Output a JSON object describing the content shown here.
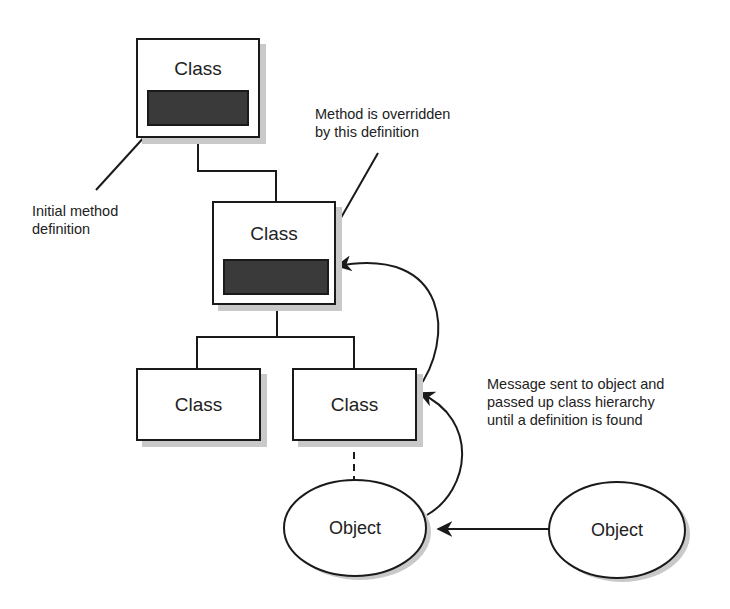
{
  "diagram": {
    "type": "class-hierarchy-method-lookup",
    "colors": {
      "stroke": "#1a1a1a",
      "method_fill": "#3a3a3a",
      "shadow": "#c9c9c9",
      "background": "#ffffff"
    },
    "classes": [
      {
        "id": "top",
        "label": "Class",
        "has_method": true
      },
      {
        "id": "middle",
        "label": "Class",
        "has_method": true
      },
      {
        "id": "bottom-left",
        "label": "Class",
        "has_method": false
      },
      {
        "id": "bottom-right",
        "label": "Class",
        "has_method": false
      }
    ],
    "objects": [
      {
        "id": "instance",
        "label": "Object"
      },
      {
        "id": "sender",
        "label": "Object"
      }
    ],
    "annotations": {
      "initial": [
        "Initial method",
        "definition"
      ],
      "override": [
        "Method is overridden",
        "by this definition"
      ],
      "message": [
        "Message sent to object and",
        "passed up class hierarchy",
        "until a definition is found"
      ]
    }
  }
}
